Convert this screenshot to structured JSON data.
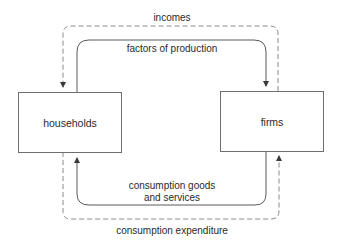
{
  "diagram": {
    "nodes": {
      "households": {
        "label": "households"
      },
      "firms": {
        "label": "firms"
      }
    },
    "flows": {
      "incomes": {
        "label": "incomes",
        "style": "dashed",
        "from": "firms",
        "to": "households",
        "position": "top-outer"
      },
      "factors": {
        "label": "factors of production",
        "style": "solid",
        "from": "households",
        "to": "firms",
        "position": "top-inner"
      },
      "goods": {
        "label_line1": "consumption goods",
        "label_line2": "and services",
        "style": "solid",
        "from": "firms",
        "to": "households",
        "position": "bottom-inner"
      },
      "expenditure": {
        "label": "consumption expenditure",
        "style": "dashed",
        "from": "households",
        "to": "firms",
        "position": "bottom-outer"
      }
    },
    "colors": {
      "background": "#ffffff",
      "text": "#2a2a2a",
      "solid_line": "#5a5a5a",
      "dashed_line": "#8a8a8a",
      "box_border": "#6e6e6e"
    }
  }
}
